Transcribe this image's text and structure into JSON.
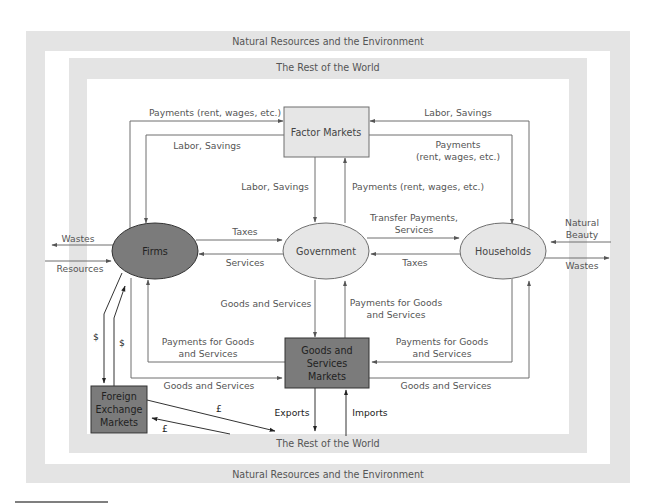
{
  "colors": {
    "band_gray": "#e4e4e4",
    "white": "#ffffff",
    "factor_markets_fill": "#e6e6e6",
    "firms_fill": "#7b7b7b",
    "government_fill": "#e6e6e6",
    "households_fill": "#e6e6e6",
    "goods_markets_fill": "#7b7b7b",
    "forex_fill": "#7b7b7b",
    "line": "#6e6e6e",
    "text": "#555555"
  },
  "bands": {
    "outer_top": "Natural Resources and the Environment",
    "outer_bottom": "Natural Resources and the Environment",
    "inner_top": "The Rest of the World",
    "inner_bottom": "The Rest of the World"
  },
  "nodes": {
    "factor_markets": "Factor Markets",
    "firms": "Firms",
    "government": "Government",
    "households": "Households",
    "goods_markets": [
      "Goods and",
      "Services",
      "Markets"
    ],
    "forex": [
      "Foreign",
      "Exchange",
      "Markets"
    ]
  },
  "flows": {
    "firms_to_factor_payments": "Payments (rent, wages, etc.)",
    "factor_to_firms_labor": "Labor, Savings",
    "households_to_factor_labor": "Labor, Savings",
    "factor_to_households_payments": [
      "Payments",
      "(rent, wages, etc.)"
    ],
    "factor_to_gov_labor": "Labor, Savings",
    "gov_to_factor_payments": "Payments (rent, wages, etc.)",
    "firms_to_gov_taxes": "Taxes",
    "gov_to_firms_services": "Services",
    "gov_to_households": [
      "Transfer Payments,",
      "Services"
    ],
    "households_to_gov_taxes": "Taxes",
    "firms_wastes": "Wastes",
    "firms_resources": "Resources",
    "households_natural_beauty": [
      "Natural",
      "Beauty"
    ],
    "households_wastes": "Wastes",
    "goods_to_gov": "Goods and Services",
    "gov_to_goods_payments": [
      "Payments for Goods",
      "and Services"
    ],
    "goods_to_firms_payments": [
      "Payments for Goods",
      "and Services"
    ],
    "firms_to_goods": "Goods and Services",
    "households_to_goods_payments": [
      "Payments for Goods",
      "and Services"
    ],
    "goods_to_households": "Goods and Services",
    "exports": "Exports",
    "imports": "Imports",
    "firms_forex_dollar_down": "$",
    "forex_firms_dollar_up": "$",
    "forex_world_pound_out": "£",
    "world_forex_pound_in": "£"
  }
}
